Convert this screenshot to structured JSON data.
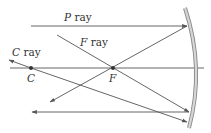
{
  "diagram": {
    "type": "concave-mirror-ray-diagram",
    "labels": {
      "p_ray": "P ray",
      "f_ray": "F ray",
      "c_ray": "C ray",
      "point_c": "C",
      "point_f": "F"
    },
    "colors": {
      "ray": "#555555",
      "axis": "#666666",
      "mirror": "#bdbdbd",
      "mirror_edge": "#8a8a8a",
      "text": "#333333",
      "point": "#333333"
    },
    "points": {
      "C": {
        "x": 31,
        "y": 68
      },
      "F": {
        "x": 113,
        "y": 68
      }
    }
  }
}
